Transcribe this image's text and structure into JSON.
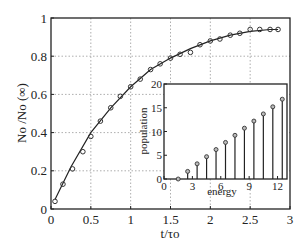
{
  "chart_data": [
    {
      "type": "scatter",
      "title": "",
      "xlabel": "t/τo",
      "ylabel": "No /No (∞)",
      "xlim": [
        0,
        3
      ],
      "ylim": [
        0,
        1
      ],
      "xticks": [
        0,
        0.5,
        1,
        1.5,
        2,
        2.5,
        3
      ],
      "xtick_labels": [
        "0",
        "0.5",
        "1",
        "1.5",
        "2",
        "2.5",
        "3"
      ],
      "yticks": [
        0,
        0.2,
        0.4,
        0.6,
        0.8,
        1
      ],
      "ytick_labels": [
        "0",
        "0.2",
        "0.4",
        "0.6",
        "0.8",
        "1"
      ],
      "grid": "dotted",
      "series": [
        {
          "name": "simulation",
          "style": "open-circles",
          "x": [
            0.05,
            0.15,
            0.27,
            0.4,
            0.5,
            0.62,
            0.75,
            0.87,
            1.0,
            1.12,
            1.25,
            1.37,
            1.5,
            1.62,
            1.75,
            1.87,
            2.0,
            2.12,
            2.25,
            2.37,
            2.5,
            2.62,
            2.75,
            2.85
          ],
          "y": [
            0.04,
            0.13,
            0.21,
            0.3,
            0.38,
            0.45,
            0.53,
            0.59,
            0.64,
            0.68,
            0.73,
            0.76,
            0.79,
            0.8,
            0.81,
            0.83,
            0.87,
            0.88,
            0.89,
            0.9,
            0.91,
            0.92,
            0.93,
            0.94
          ],
          "y_adjusted": [
            0.04,
            0.13,
            0.21,
            0.3,
            0.38,
            0.46,
            0.53,
            0.59,
            0.64,
            0.68,
            0.73,
            0.76,
            0.79,
            0.81,
            0.82,
            0.86,
            0.88,
            0.89,
            0.91,
            0.92,
            0.94,
            0.94,
            0.94,
            0.94
          ]
        },
        {
          "name": "theory",
          "style": "solid-line",
          "x": [
            0.05,
            0.25,
            0.5,
            0.75,
            1.0,
            1.25,
            1.5,
            1.75,
            2.0,
            2.25,
            2.5,
            2.75,
            2.85
          ],
          "y": [
            0.05,
            0.22,
            0.4,
            0.53,
            0.64,
            0.73,
            0.79,
            0.84,
            0.88,
            0.91,
            0.93,
            0.94,
            0.94
          ]
        }
      ]
    },
    {
      "type": "bar",
      "subtype": "stem",
      "role": "inset",
      "title": "",
      "xlabel": "energy",
      "ylabel": "population",
      "xlim": [
        0,
        13
      ],
      "ylim": [
        0,
        20
      ],
      "xticks": [
        0,
        3,
        6,
        9,
        12
      ],
      "xtick_labels": [
        "0",
        "3",
        "6",
        "9",
        "12"
      ],
      "yticks": [
        0,
        5,
        10,
        15,
        20
      ],
      "ytick_labels": [
        "0",
        "5",
        "10",
        "15",
        "20"
      ],
      "categories": [
        1.5,
        2.5,
        3.5,
        4.5,
        5.5,
        6.5,
        7.5,
        8.5,
        9.5,
        10.5,
        11.5,
        12.5
      ],
      "values": [
        0,
        1.6,
        3.2,
        4.7,
        6.2,
        7.7,
        9.2,
        10.7,
        12.2,
        13.7,
        15.2,
        16.8
      ]
    }
  ]
}
